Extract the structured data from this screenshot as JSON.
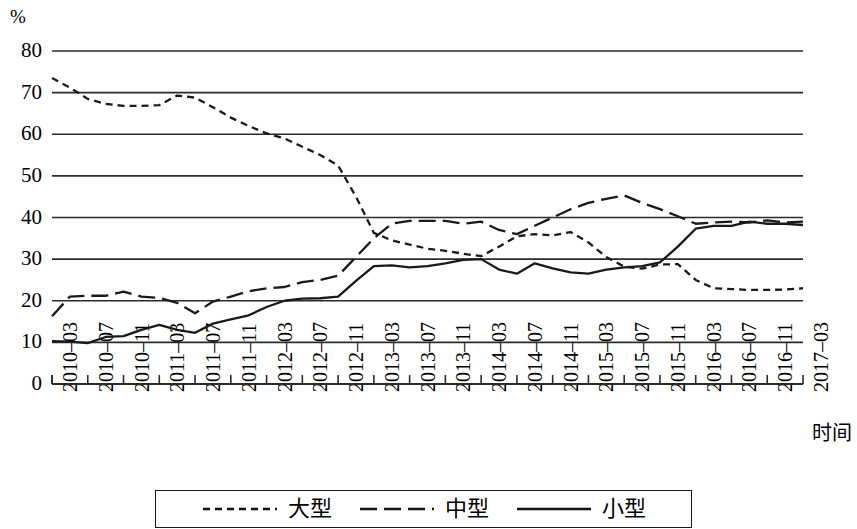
{
  "chart_data": {
    "type": "line",
    "title": "",
    "unit_label": "%",
    "xlabel": "时间",
    "ylabel": "",
    "grid": true,
    "legend_position": "bottom",
    "ylim": [
      0,
      80
    ],
    "yticks": [
      0,
      10,
      20,
      30,
      40,
      50,
      60,
      70,
      80
    ],
    "x": [
      "2010-03",
      "2010-05",
      "2010-07",
      "2010-09",
      "2010-11",
      "2011-01",
      "2011-03",
      "2011-05",
      "2011-07",
      "2011-09",
      "2011-11",
      "2012-01",
      "2012-03",
      "2012-05",
      "2012-07",
      "2012-09",
      "2012-11",
      "2013-01",
      "2013-03",
      "2013-05",
      "2013-07",
      "2013-09",
      "2013-11",
      "2014-01",
      "2014-03",
      "2014-05",
      "2014-07",
      "2014-09",
      "2014-11",
      "2015-01",
      "2015-03",
      "2015-05",
      "2015-07",
      "2015-09",
      "2015-11",
      "2016-01",
      "2016-03",
      "2016-05",
      "2016-07",
      "2016-09",
      "2016-11",
      "2017-01",
      "2017-03"
    ],
    "xticks": [
      "2010-03",
      "2010-07",
      "2010-11",
      "2011-03",
      "2011-07",
      "2011-11",
      "2012-03",
      "2012-07",
      "2012-11",
      "2013-03",
      "2013-07",
      "2013-11",
      "2014-03",
      "2014-07",
      "2014-11",
      "2015-03",
      "2015-07",
      "2015-11",
      "2016-03",
      "2016-07",
      "2016-11",
      "2017-03"
    ],
    "series": [
      {
        "name": "大型",
        "style": "dotted",
        "color": "#1a1a1a",
        "values": [
          73.5,
          71.2,
          68.5,
          67.3,
          66.8,
          66.8,
          67.0,
          69.3,
          68.8,
          66.5,
          64.0,
          62.0,
          60.2,
          59.0,
          57.0,
          55.0,
          52.5,
          45.0,
          36.3,
          34.5,
          33.5,
          32.5,
          32.0,
          31.3,
          30.7,
          33.0,
          35.5,
          36.0,
          35.7,
          36.5,
          34.0,
          30.5,
          28.2,
          27.7,
          28.7,
          28.8,
          25.0,
          23.0,
          22.8,
          22.6,
          22.6,
          22.7,
          23.0
        ]
      },
      {
        "name": "中型",
        "style": "dashed",
        "color": "#1a1a1a",
        "values": [
          16.3,
          21.0,
          21.2,
          21.2,
          22.2,
          21.0,
          20.7,
          19.5,
          17.0,
          19.8,
          21.0,
          22.3,
          23.0,
          23.3,
          24.5,
          25.0,
          26.0,
          30.5,
          35.0,
          38.5,
          39.2,
          39.2,
          39.2,
          38.5,
          39.0,
          37.0,
          36.0,
          38.0,
          40.0,
          42.0,
          43.5,
          44.5,
          45.3,
          43.5,
          42.0,
          40.3,
          38.5,
          38.8,
          39.0,
          38.8,
          39.3,
          38.8,
          39.0
        ]
      },
      {
        "name": "小型",
        "style": "solid",
        "color": "#1a1a1a",
        "values": [
          10.3,
          10.2,
          9.8,
          11.3,
          11.5,
          13.0,
          14.2,
          13.0,
          12.3,
          14.5,
          15.5,
          16.5,
          18.5,
          20.0,
          20.5,
          20.6,
          21.0,
          24.8,
          28.3,
          28.5,
          28.0,
          28.3,
          29.0,
          29.8,
          30.0,
          27.5,
          26.5,
          29.0,
          27.8,
          26.8,
          26.5,
          27.5,
          28.0,
          28.3,
          29.2,
          33.0,
          37.3,
          38.0,
          38.0,
          39.0,
          38.5,
          38.5,
          38.2
        ]
      }
    ]
  },
  "legend": {
    "items": [
      {
        "label": "大型",
        "style": "dotted"
      },
      {
        "label": "中型",
        "style": "dashed"
      },
      {
        "label": "小型",
        "style": "solid"
      }
    ]
  }
}
